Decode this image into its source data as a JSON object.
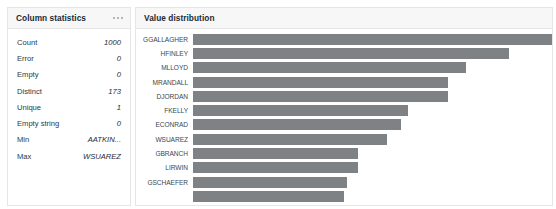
{
  "stats_panel": {
    "title": "Column statistics",
    "menu_icon": "ellipsis-icon",
    "rows": [
      {
        "label": "Count",
        "value": "1000"
      },
      {
        "label": "Error",
        "value": "0"
      },
      {
        "label": "Empty",
        "value": "0"
      },
      {
        "label": "Distinct",
        "value": "173"
      },
      {
        "label": "Unique",
        "value": "1"
      },
      {
        "label": "Empty string",
        "value": "0"
      },
      {
        "label": "Min",
        "value": "AATKIN..."
      },
      {
        "label": "Max",
        "value": "WSUAREZ"
      }
    ]
  },
  "distribution_panel": {
    "title": "Value distribution"
  },
  "watermark": {
    "text": "Summary"
  },
  "chart_data": {
    "type": "bar",
    "title": "Value distribution",
    "orientation": "horizontal",
    "xlabel": "",
    "ylabel": "",
    "grid": false,
    "legend": false,
    "categories": [
      "GGALLAGHER",
      "HFINLEY",
      "MLLOYD",
      "MRANDALL",
      "DJORDAN",
      "FKELLY",
      "ECONRAD",
      "WSUAREZ",
      "GBRANCH",
      "LIRWIN",
      "GSCHAEFER",
      ""
    ],
    "values": [
      100,
      88,
      76,
      71,
      71,
      60,
      58,
      54,
      46,
      46,
      43,
      42
    ],
    "value_unit": "relative-width-percent",
    "xlim": [
      0,
      100
    ]
  }
}
